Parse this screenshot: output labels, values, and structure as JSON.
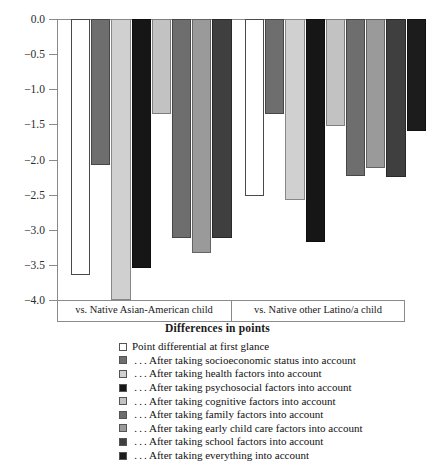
{
  "chart_data": {
    "type": "bar",
    "title": "",
    "xlabel": "Differences in points",
    "ylabel": "",
    "ylim": [
      -4.0,
      0.0
    ],
    "yticks": [
      "0.0",
      "-0.5",
      "-1.0",
      "-1.5",
      "-2.0",
      "-2.5",
      "-3.0",
      "-3.5",
      "-4.0"
    ],
    "ytick_values": [
      0.0,
      -0.5,
      -1.0,
      -1.5,
      -2.0,
      -2.5,
      -3.0,
      -3.5,
      -4.0
    ],
    "grid": false,
    "legend_position": "below",
    "categories": [
      "vs. Native Asian-American child",
      "vs. Native other Latino/a child"
    ],
    "series": [
      {
        "name": "Point differential at first glance",
        "color": "#ffffff",
        "values": [
          -3.65,
          -2.52
        ]
      },
      {
        "name": "... After taking socioeconomic status into account",
        "color": "#6e6e6e",
        "values": [
          -2.08,
          -1.35
        ]
      },
      {
        "name": "... After taking health factors into account",
        "color": "#d0d0d0",
        "values": [
          -4.0,
          -2.57
        ]
      },
      {
        "name": "... After taking psychosocial factors into account",
        "color": "#161616",
        "values": [
          -3.55,
          -3.18
        ]
      },
      {
        "name": "... After taking cognitive factors into account",
        "color": "#c2c2c2",
        "values": [
          -1.35,
          -1.52
        ]
      },
      {
        "name": "... After taking family factors into account",
        "color": "#6e6e6e",
        "values": [
          -3.12,
          -2.23
        ]
      },
      {
        "name": "... After taking early child care factors into account",
        "color": "#9a9a9a",
        "values": [
          -3.33,
          -2.12
        ]
      },
      {
        "name": "... After taking school factors into account",
        "color": "#3f3f3f",
        "values": [
          -3.12,
          -2.25
        ]
      },
      {
        "name": "... After taking everything into account",
        "color": "#1c1c1c",
        "values": [
          null,
          -1.6
        ]
      }
    ]
  },
  "legend": {
    "items": [
      {
        "label": "Point differential at first glance",
        "color": "#ffffff"
      },
      {
        "label": " . . . After taking socioeconomic status into account",
        "color": "#6e6e6e"
      },
      {
        "label": " . . . After taking health factors into account",
        "color": "#d0d0d0"
      },
      {
        "label": " . . . After taking psychosocial factors into account",
        "color": "#161616"
      },
      {
        "label": " . . . After taking cognitive factors into account",
        "color": "#c2c2c2"
      },
      {
        "label": " . . . After taking family factors into account",
        "color": "#6e6e6e"
      },
      {
        "label": " . . . After taking early child care factors into account",
        "color": "#9a9a9a"
      },
      {
        "label": " . . . After taking school factors into account",
        "color": "#3f3f3f"
      },
      {
        "label": " . . . After taking everything into account",
        "color": "#1c1c1c"
      }
    ]
  },
  "axes": {
    "x_title": "Differences in points",
    "group_labels": [
      "vs. Native Asian-American child",
      "vs. Native other Latino/a child"
    ]
  }
}
